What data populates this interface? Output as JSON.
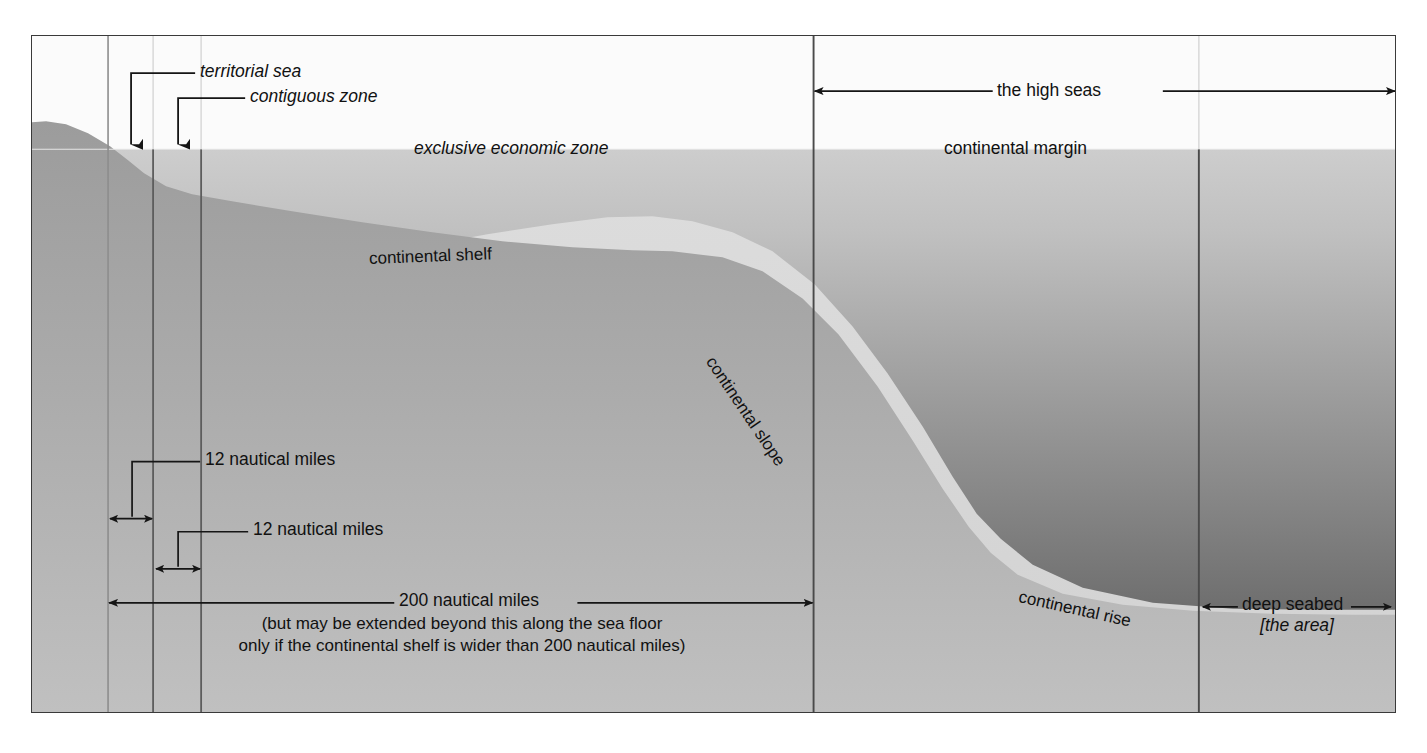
{
  "diagram": {
    "frame": {
      "x": 31,
      "y": 35,
      "width": 1365,
      "height": 678
    },
    "colors": {
      "border": "#3a3a3a",
      "sky": "#fbfbfb",
      "water_top": "#c9c9c9",
      "water_bottom": "#6f6f6f",
      "seabed_light": "#dcdcdc",
      "seabed_dark": "#c2c2c2",
      "land_top": "#9a9a9a",
      "land_bottom": "#b8b8b8",
      "text": "#111111",
      "rule": "#4a4a4a"
    },
    "geometry": {
      "sea_surface_y": 148,
      "baseline_x": 107,
      "territorial_sea_limit_x": 152,
      "contiguous_zone_limit_x": 200,
      "eez_limit_x": 812,
      "deep_seabed_start_x": 1197,
      "frame_right_x": 1394,
      "shelf_break_x": 620,
      "slope_foot_x": 960
    }
  },
  "labels": {
    "territorial_sea": "territorial sea",
    "contiguous_zone": "contiguous zone",
    "exclusive_economic_zone": "exclusive economic zone",
    "high_seas": "the high seas",
    "continental_margin": "continental margin",
    "continental_shelf": "continental shelf",
    "continental_slope": "continental slope",
    "continental_rise": "continental rise",
    "deep_seabed": "deep seabed",
    "the_area": "[the area]",
    "twelve_nm_first": "12 nautical miles",
    "twelve_nm_second": "12 nautical miles",
    "two_hundred_nm": "200 nautical miles",
    "two_hundred_nm_note_line1": "(but may be extended beyond this along the sea floor",
    "two_hundred_nm_note_line2": "only if the continental shelf is wider than 200 nautical miles)"
  },
  "measurements": {
    "territorial_sea_breadth": "12 nautical miles",
    "contiguous_zone_breadth": "12 nautical miles",
    "eez_breadth": "200 nautical miles"
  },
  "icons": {
    "down_arrow": "down-arrow-icon",
    "double_arrow": "double-headed-arrow-icon",
    "right_arrow": "right-arrow-icon",
    "left_arrow": "left-arrow-icon"
  }
}
